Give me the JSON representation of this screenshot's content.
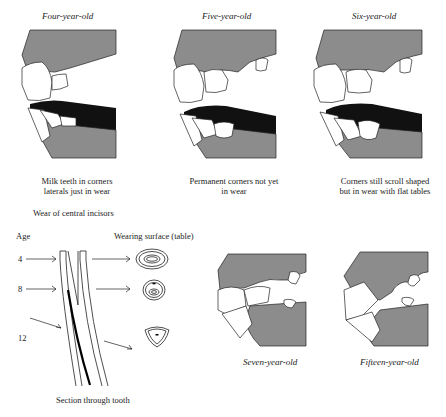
{
  "figure": {
    "top_panels": [
      {
        "title": "Four-year-old",
        "caption_line1": "Milk teeth in corners",
        "caption_line2": "laterals just in wear"
      },
      {
        "title": "Five-year-old",
        "caption_line1": "Permanent corners not yet",
        "caption_line2": "in wear"
      },
      {
        "title": "Six-year-old",
        "caption_line1": "Corners still scroll shaped",
        "caption_line2": "but in wear with flat tables"
      }
    ],
    "wear_section": {
      "heading": "Wear of central incisors",
      "age_label": "Age",
      "surface_label": "Wearing surface (table)",
      "ages": [
        "4",
        "8",
        "12"
      ],
      "caption": "Section through tooth"
    },
    "bottom_panels": [
      {
        "title": "Seven-year-old"
      },
      {
        "title": "Fifteen-year-old"
      }
    ],
    "colors": {
      "gum": "#8c8c8c",
      "mouth": "#111111",
      "tooth": "#ffffff",
      "line": "#222222"
    }
  }
}
